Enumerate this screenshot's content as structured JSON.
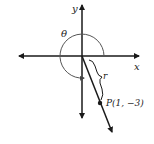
{
  "diagram": {
    "axes": {
      "x_label": "x",
      "y_label": "y"
    },
    "angle_label": "θ",
    "radius_label": "r",
    "point": {
      "label": "P(1, −3)",
      "x": 1,
      "y": -3
    },
    "colors": {
      "stroke": "#1a1a1a",
      "arc": "#555555"
    }
  }
}
